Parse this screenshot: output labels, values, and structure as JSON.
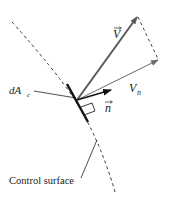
{
  "diagram": {
    "type": "control-surface flux element",
    "labels": {
      "velocity": "V",
      "normal_component": "V",
      "normal_component_sub": "n",
      "unit_normal": "n",
      "area_element": "dA",
      "area_element_sub": "c",
      "surface": "Control surface"
    },
    "colors": {
      "velocity_vector": "#5a5a5a",
      "normal_component_vector": "#6a6a6a",
      "unit_normal": "#111111",
      "surface_dashed": "#333333",
      "area_element": "#111111"
    }
  }
}
